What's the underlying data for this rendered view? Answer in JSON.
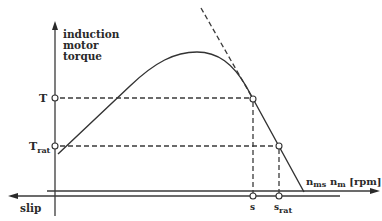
{
  "diagram": {
    "y_axis_label": [
      "induction",
      "motor",
      "torque"
    ],
    "x_axis_label": {
      "main": "n",
      "sub": "m",
      "unit": " [rpm]"
    },
    "slip_axis_label": "slip",
    "sync_speed_label": {
      "main": "n",
      "sub": "ms"
    },
    "torque_labels": {
      "T": "T",
      "T_rat": {
        "main": "T",
        "sub": "rat"
      }
    },
    "slip_labels": {
      "s": "s",
      "s_rat": {
        "main": "s",
        "sub": "rat"
      }
    },
    "colors": {
      "line": "#333333",
      "background": "#ffffff"
    }
  }
}
